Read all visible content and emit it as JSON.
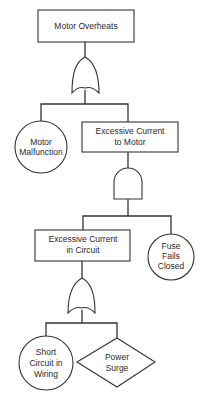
{
  "diagram": {
    "type": "fault-tree",
    "colors": {
      "stroke": "#333333",
      "text": "#2a2a2a",
      "background": "#ffffff"
    },
    "nodes": {
      "top_event": {
        "kind": "rectangle",
        "lines": [
          "Motor Overheats"
        ]
      },
      "gate1": {
        "kind": "or-gate"
      },
      "motor_malfunction": {
        "kind": "circle",
        "lines": [
          "Motor",
          "Malfunction"
        ]
      },
      "excess_motor": {
        "kind": "rectangle",
        "lines": [
          "Excessive Current",
          "to Motor"
        ]
      },
      "gate2": {
        "kind": "and-gate"
      },
      "excess_circuit": {
        "kind": "rectangle",
        "lines": [
          "Excessive Current",
          "in Circuit"
        ]
      },
      "fuse": {
        "kind": "circle",
        "lines": [
          "Fuse",
          "Fails",
          "Closed"
        ]
      },
      "gate3": {
        "kind": "or-gate"
      },
      "short_circuit": {
        "kind": "circle",
        "lines": [
          "Short",
          "Circuit in",
          "Wiring"
        ]
      },
      "power_surge": {
        "kind": "diamond",
        "lines": [
          "Power",
          "Surge"
        ]
      }
    },
    "edges": [
      [
        "top_event",
        "gate1"
      ],
      [
        "gate1",
        "motor_malfunction"
      ],
      [
        "gate1",
        "excess_motor"
      ],
      [
        "excess_motor",
        "gate2"
      ],
      [
        "gate2",
        "excess_circuit"
      ],
      [
        "gate2",
        "fuse"
      ],
      [
        "excess_circuit",
        "gate3"
      ],
      [
        "gate3",
        "short_circuit"
      ],
      [
        "gate3",
        "power_surge"
      ]
    ]
  }
}
